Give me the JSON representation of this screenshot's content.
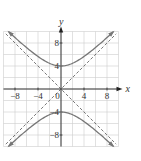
{
  "chart_data": {
    "type": "line",
    "title": "",
    "xlabel": "x",
    "ylabel": "y",
    "xlim": [
      -10,
      10
    ],
    "ylim": [
      -10,
      10
    ],
    "grid": true,
    "grid_step": 2,
    "x_ticks": [
      -8,
      -4,
      0,
      4,
      8
    ],
    "y_ticks": [
      -8,
      -4,
      4,
      8
    ],
    "x_tick_labels": [
      "-8",
      "-4",
      "0",
      "4",
      "8"
    ],
    "y_tick_labels": [
      "-8",
      "-4",
      "4",
      "8"
    ],
    "series": [
      {
        "name": "hyperbola upper branch",
        "equation": "y = sqrt(16 + x^2)",
        "style": "solid",
        "vertex": [
          0,
          4
        ]
      },
      {
        "name": "hyperbola lower branch",
        "equation": "y = -sqrt(16 + x^2)",
        "style": "solid",
        "vertex": [
          0,
          -4
        ]
      },
      {
        "name": "asymptote",
        "equation": "y = x",
        "style": "dashed"
      },
      {
        "name": "asymptote",
        "equation": "y = -x",
        "style": "dashed"
      }
    ],
    "colors": {
      "curve": "#777777",
      "asymptote": "#555555",
      "grid": "#cccccc",
      "axis": "#222222"
    }
  }
}
